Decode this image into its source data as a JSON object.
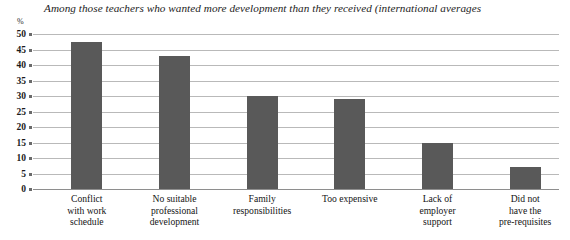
{
  "chart_data": {
    "type": "bar",
    "title": "Among those teachers who wanted more development than they received (international averages",
    "xlabel": "",
    "ylabel": "%",
    "ylim": [
      0,
      50
    ],
    "grid": true,
    "legend": "none",
    "orientation": "vertical",
    "bar_color": "#595959",
    "categories": [
      "Conflict with work schedule",
      "No suitable professional development",
      "Family responsibilities",
      "Too expensive",
      "Lack of employer support",
      "Did not have the pre-requisites"
    ],
    "category_lines": [
      [
        "Conflict",
        "with work",
        "schedule"
      ],
      [
        "No suitable",
        "professional",
        "development"
      ],
      [
        "Family",
        "responsibilities"
      ],
      [
        "Too expensive"
      ],
      [
        "Lack of",
        "employer",
        "support"
      ],
      [
        "Did not",
        "have the",
        "pre-requisites"
      ]
    ],
    "values": [
      47.5,
      43,
      30,
      29,
      15,
      7
    ],
    "yticks": [
      50,
      45,
      40,
      35,
      30,
      25,
      20,
      15,
      10,
      5,
      0
    ],
    "ytick_labels": [
      "50",
      "45",
      "40",
      "35",
      "30",
      "25",
      "20",
      "15",
      "10",
      "5",
      "0"
    ]
  }
}
